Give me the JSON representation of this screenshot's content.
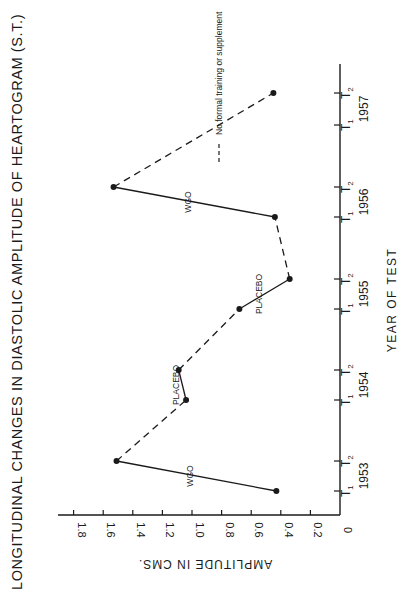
{
  "chart_data": {
    "type": "line",
    "orientation": "rotated-90-ccw",
    "title": "LONGITUDINAL CHANGES IN DIASTOLIC AMPLITUDE OF HEARTOGRAM (S.T.)",
    "xlabel": "YEAR OF TEST",
    "ylabel": "AMPLITUDE IN CMS.",
    "ylim": [
      0,
      1.8
    ],
    "yticks": [
      "0",
      "0.2",
      "0.4",
      "0.6",
      "0.8",
      "1.0",
      "1.2",
      "1.4",
      "1.6",
      "1.8"
    ],
    "grid": false,
    "categories": [
      {
        "year": "1953",
        "test": "T1"
      },
      {
        "year": "1953",
        "test": "T2"
      },
      {
        "year": "1954",
        "test": "T1"
      },
      {
        "year": "1954",
        "test": "T2"
      },
      {
        "year": "1955",
        "test": "T1"
      },
      {
        "year": "1955",
        "test": "T2"
      },
      {
        "year": "1956",
        "test": "T1"
      },
      {
        "year": "1956",
        "test": "T2"
      },
      {
        "year": "1957",
        "test": "T1"
      },
      {
        "year": "1957",
        "test": "T2"
      }
    ],
    "years": [
      "1953",
      "1954",
      "1955",
      "1956",
      "1957"
    ],
    "points": [
      {
        "label": "1953 T1",
        "value": 0.43
      },
      {
        "label": "1953 T2",
        "value": 1.51
      },
      {
        "label": "1954 T1",
        "value": 1.04
      },
      {
        "label": "1954 T2",
        "value": 1.09
      },
      {
        "label": "1955 T1",
        "value": 0.68
      },
      {
        "label": "1955 T2",
        "value": 0.34
      },
      {
        "label": "1956 T1",
        "value": 0.44
      },
      {
        "label": "1956 T2",
        "value": 1.53
      },
      {
        "label": "1957 T2",
        "value": 0.45
      }
    ],
    "segments": [
      {
        "from": 0,
        "to": 1,
        "style": "solid",
        "annotation": "WGO"
      },
      {
        "from": 1,
        "to": 2,
        "style": "dashed",
        "annotation": ""
      },
      {
        "from": 2,
        "to": 3,
        "style": "solid",
        "annotation": "PLACEBO"
      },
      {
        "from": 3,
        "to": 4,
        "style": "dashed",
        "annotation": ""
      },
      {
        "from": 4,
        "to": 5,
        "style": "solid",
        "annotation": "PLACEBO"
      },
      {
        "from": 5,
        "to": 6,
        "style": "dashed",
        "annotation": ""
      },
      {
        "from": 6,
        "to": 7,
        "style": "solid",
        "annotation": "WGO"
      },
      {
        "from": 7,
        "to": 8,
        "style": "dashed",
        "annotation": ""
      }
    ],
    "legend": [
      {
        "style": "dashed",
        "label": "No formal training or supplement"
      }
    ]
  },
  "colors": {
    "ink": "#1a1a1a",
    "background": "#ffffff"
  }
}
